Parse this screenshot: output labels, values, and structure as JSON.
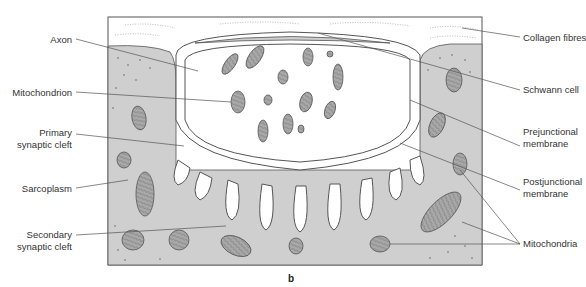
{
  "figure": {
    "caption": "b",
    "colors": {
      "sarcoplasm": "#cfcfcf",
      "outline": "#555555",
      "mito_fill": "#a9a9a9",
      "background": "#ffffff"
    }
  },
  "labels_left": [
    {
      "id": "axon",
      "lines": [
        "Axon"
      ]
    },
    {
      "id": "mitochondrion",
      "lines": [
        "Mitochondrion"
      ]
    },
    {
      "id": "primary-synaptic-cleft",
      "lines": [
        "Primary",
        "synaptic cleft"
      ]
    },
    {
      "id": "sarcoplasm",
      "lines": [
        "Sarcoplasm"
      ]
    },
    {
      "id": "secondary-synaptic-cleft",
      "lines": [
        "Secondary",
        "synaptic cleft"
      ]
    }
  ],
  "labels_right": [
    {
      "id": "collagen-fibres",
      "lines": [
        "Collagen fibres"
      ]
    },
    {
      "id": "schwann-cell",
      "lines": [
        "Schwann cell"
      ]
    },
    {
      "id": "prejunctional-membrane",
      "lines": [
        "Prejunctional",
        "membrane"
      ]
    },
    {
      "id": "postjunctional-membrane",
      "lines": [
        "Postjunctional",
        "membrane"
      ]
    },
    {
      "id": "mitochondria",
      "lines": [
        "Mitochondria"
      ]
    }
  ]
}
